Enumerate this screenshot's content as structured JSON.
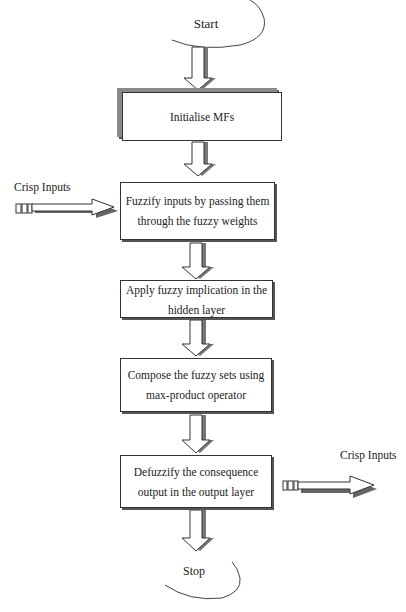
{
  "diagram": {
    "type": "flowchart",
    "start": {
      "label": "Start"
    },
    "stop": {
      "label": "Stop"
    },
    "steps": [
      {
        "label": "Initialise MFs"
      },
      {
        "label": "Fuzzify inputs by passing them through the fuzzy weights"
      },
      {
        "label": "Apply fuzzy implication in the hidden layer"
      },
      {
        "label": "Compose the fuzzy sets using max-product operator"
      },
      {
        "label": "Defuzzify the consequence output in the output layer"
      }
    ],
    "side_inputs": [
      {
        "label": "Crisp Inputs",
        "attached_to_step": 1,
        "direction": "in"
      },
      {
        "label": "Crisp Inputs",
        "attached_to_step": 4,
        "direction": "out"
      }
    ],
    "colors": {
      "line": "#333333",
      "shadow": "#555555",
      "background": "#ffffff"
    }
  }
}
